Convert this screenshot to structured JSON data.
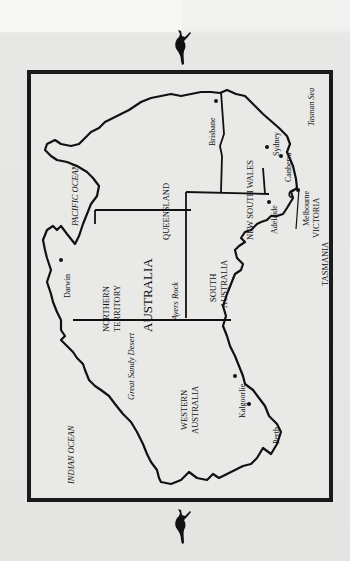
{
  "map": {
    "title": "AUSTRALIA",
    "orientation": "rotated 90° counter-clockwise",
    "oceans": [
      {
        "id": "pacific",
        "label": "PACIFIC OCEAN"
      },
      {
        "id": "indian",
        "label": "INDIAN OCEAN"
      },
      {
        "id": "tasman",
        "label": "Tasman Sea"
      }
    ],
    "states": [
      {
        "id": "qld",
        "label": "QUEENSLAND"
      },
      {
        "id": "nsw",
        "label": "NEW SOUTH WALES"
      },
      {
        "id": "nt",
        "line1": "NORTHERN",
        "line2": "TERRITORY"
      },
      {
        "id": "sa",
        "line1": "SOUTH",
        "line2": "AUSTRALIA"
      },
      {
        "id": "wa",
        "line1": "WESTERN",
        "line2": "AUSTRALIA"
      },
      {
        "id": "vic",
        "label": "VICTORIA"
      },
      {
        "id": "tas",
        "label": "TASMANIA"
      }
    ],
    "features": [
      {
        "id": "ayers",
        "label": "Ayers Rock"
      },
      {
        "id": "desert",
        "label": "Great Sandy Desert"
      }
    ],
    "cities": [
      {
        "id": "brisbane",
        "label": "Brisbane"
      },
      {
        "id": "sydney",
        "label": "Sydney"
      },
      {
        "id": "canberra",
        "label": "Canberra"
      },
      {
        "id": "melbourne",
        "label": "Melbourne"
      },
      {
        "id": "adelaide",
        "label": "Adelaide"
      },
      {
        "id": "darwin",
        "label": "Darwin"
      },
      {
        "id": "kalgoorlie",
        "label": "Kalgoorlie"
      },
      {
        "id": "perth",
        "label": "Perth"
      }
    ]
  },
  "decorations": {
    "top_icon": "kangaroo-icon",
    "bottom_icon": "kangaroo-icon"
  }
}
